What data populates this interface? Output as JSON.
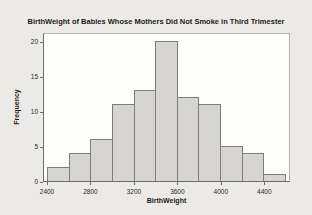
{
  "window": {
    "title": "BirthWeight of Babies Whose Mothers Did Not Smoke in Third Trimester"
  },
  "chart_data": {
    "type": "bar",
    "subtype": "histogram",
    "title": "BirthWeight of Babies Whose Mothers Did Not Smoke in Third Trimester",
    "xlabel": "BirthWeight",
    "ylabel": "Frequency",
    "bin_width": 200,
    "bin_edges": [
      2400,
      2600,
      2800,
      3000,
      3200,
      3400,
      3600,
      3800,
      4000,
      4200,
      4400,
      4600
    ],
    "values": [
      2,
      4,
      6,
      11,
      13,
      20,
      12,
      11,
      5,
      4,
      1
    ],
    "x_tick_values": [
      2400,
      2800,
      3200,
      3600,
      4000,
      4400
    ],
    "x_tick_labels": [
      "2400",
      "2800",
      "3200",
      "3600",
      "4000",
      "4400"
    ],
    "y_tick_values": [
      0,
      5,
      10,
      15,
      20
    ],
    "y_tick_labels": [
      "0",
      "5",
      "10",
      "15",
      "20"
    ],
    "xlim": [
      2400,
      4600
    ],
    "ylim": [
      0,
      21.3
    ],
    "grid": false,
    "legend": "none",
    "bar_fill": "#d6d5d2",
    "bar_border": "#7d7d7b"
  },
  "colors": {
    "page_bg": "#eceae7",
    "plot_bg": "#fdfdfc",
    "frame_border": "#b3b3b0",
    "axis_color": "#6d6d6a",
    "text_color": "#1c1c1c"
  }
}
